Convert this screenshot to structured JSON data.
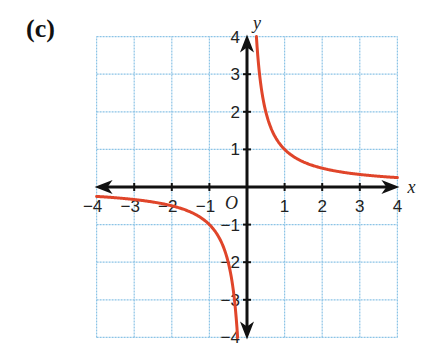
{
  "panel_label": "(c)",
  "colors": {
    "grid": "#8cc4e6",
    "axis": "#111111",
    "curve": "#e0452a"
  },
  "chart_data": {
    "type": "line",
    "title": "",
    "panel_label": "(c)",
    "function": "y = 1/x",
    "xlabel": "x",
    "ylabel": "y",
    "origin_label": "O",
    "xlim": [
      -4,
      4
    ],
    "ylim": [
      -4,
      4
    ],
    "grid": true,
    "x_ticks": [
      -4,
      -3,
      -2,
      -1,
      1,
      2,
      3,
      4
    ],
    "y_ticks": [
      -4,
      -3,
      -2,
      -1,
      1,
      2,
      3,
      4
    ],
    "x_tick_labels": [
      "−4",
      "−3",
      "−2",
      "−1",
      "1",
      "2",
      "3",
      "4"
    ],
    "y_tick_labels": [
      "−4",
      "−3",
      "−2",
      "−1",
      "1",
      "2",
      "3",
      "4"
    ],
    "series": [
      {
        "name": "branch-positive",
        "x": [
          0.25,
          0.333,
          0.5,
          0.75,
          1,
          1.5,
          2,
          2.5,
          3,
          3.5,
          4
        ],
        "y": [
          4,
          3,
          2,
          1.333,
          1,
          0.667,
          0.5,
          0.4,
          0.333,
          0.286,
          0.25
        ]
      },
      {
        "name": "branch-negative",
        "x": [
          -4,
          -3.5,
          -3,
          -2.5,
          -2,
          -1.5,
          -1,
          -0.75,
          -0.5,
          -0.333,
          -0.25
        ],
        "y": [
          -0.25,
          -0.286,
          -0.333,
          -0.4,
          -0.5,
          -0.667,
          -1,
          -1.333,
          -2,
          -3,
          -4
        ]
      }
    ],
    "legend": []
  }
}
